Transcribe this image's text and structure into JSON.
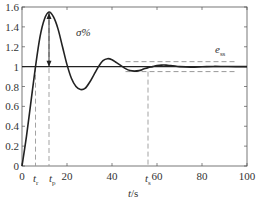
{
  "chart_data": {
    "type": "line",
    "title": "",
    "xlabel": "t/s",
    "ylabel": "",
    "xlim": [
      0,
      100
    ],
    "ylim": [
      0,
      1.6
    ],
    "x_ticks": [
      "0",
      "20",
      "40",
      "60",
      "80",
      "100"
    ],
    "y_ticks": [
      "0",
      "0.2",
      "0.4",
      "0.6",
      "0.8",
      "1",
      "1.2",
      "1.4",
      "1.6"
    ],
    "grid": false,
    "series": [
      {
        "name": "step response",
        "x": [
          0,
          2,
          4,
          6,
          8,
          10,
          12,
          14,
          16,
          18,
          20,
          22,
          24,
          26,
          28,
          30,
          32,
          34,
          36,
          38,
          40,
          42,
          44,
          46,
          48,
          50,
          52,
          54,
          56,
          58,
          60,
          62,
          64,
          66,
          68,
          70,
          75,
          80,
          85,
          90,
          95,
          100
        ],
        "y": [
          0,
          0.3,
          0.65,
          1.0,
          1.3,
          1.48,
          1.55,
          1.5,
          1.38,
          1.2,
          1.02,
          0.88,
          0.8,
          0.77,
          0.78,
          0.84,
          0.92,
          1.0,
          1.06,
          1.08,
          1.07,
          1.04,
          1.01,
          0.98,
          0.96,
          0.955,
          0.96,
          0.975,
          0.99,
          1.0,
          1.01,
          1.015,
          1.015,
          1.01,
          1.005,
          1.0,
          0.995,
          0.998,
          1.002,
          1.001,
          1.0,
          1.0
        ]
      },
      {
        "name": "steady-state value",
        "x": [
          0,
          100
        ],
        "y": [
          1,
          1
        ]
      },
      {
        "name": "upper tolerance band",
        "x": [
          46,
          95
        ],
        "y": [
          1.05,
          1.05
        ],
        "style": "dashed"
      },
      {
        "name": "lower tolerance band",
        "x": [
          46,
          95
        ],
        "y": [
          0.95,
          0.95
        ],
        "style": "dashed"
      }
    ],
    "annotations": [
      {
        "text": "σ%",
        "x": 24,
        "y": 1.3
      },
      {
        "text": "e_ss",
        "x": 91,
        "y": 1.1
      },
      {
        "text": "t_r",
        "x": 6,
        "y": 0,
        "marker": "dashed vertical"
      },
      {
        "text": "t_p",
        "x": 12,
        "y": 0,
        "marker": "dashed vertical with double arrow from 1 to 1.55"
      },
      {
        "text": "t_s",
        "x": 56,
        "y": 0,
        "marker": "dashed vertical"
      }
    ]
  },
  "labels": {
    "xlabel_t": "t",
    "xlabel_unit": "/s",
    "sigma": "σ%",
    "ess_main": "e",
    "ess_sub": "ss",
    "tr_main": "t",
    "tr_sub": "r",
    "tp_main": "t",
    "tp_sub": "p",
    "ts_main": "t",
    "ts_sub": "s"
  },
  "ticks": {
    "x": [
      "0",
      "20",
      "40",
      "60",
      "80",
      "100"
    ],
    "y": [
      "0",
      "0.2",
      "0.4",
      "0.6",
      "0.8",
      "1",
      "1.2",
      "1.4",
      "1.6"
    ]
  }
}
